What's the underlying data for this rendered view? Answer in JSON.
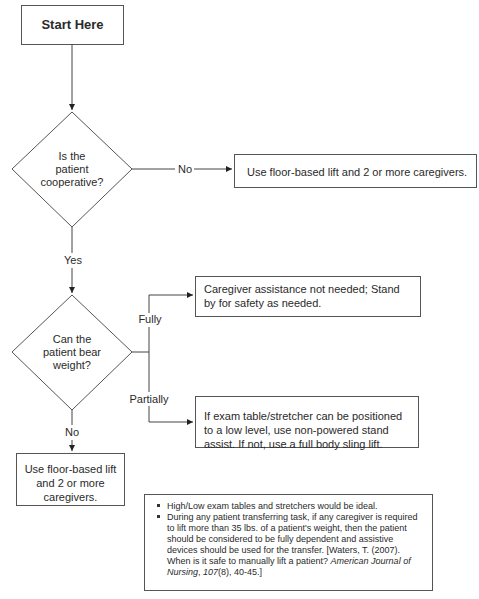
{
  "flowchart": {
    "start": {
      "label": "Start Here"
    },
    "decision1": {
      "line1": "Is the",
      "line2": "patient",
      "line3": "cooperative?"
    },
    "decision1_no_label": "No",
    "decision1_yes_label": "Yes",
    "outcome_not_cooperative": "Use floor-based lift and 2 or more caregivers.",
    "decision2": {
      "line1": "Can the",
      "line2": "patient bear",
      "line3": "weight?"
    },
    "branch_fully_label": "Fully",
    "branch_partially_label": "Partially",
    "branch_no_label": "No",
    "outcome_fully": "Caregiver assistance not needed; Stand by for safety as needed.",
    "outcome_partially": "If exam table/stretcher can be positioned to a low level, use non-powered stand assist. If not, use a full body sling lift.",
    "outcome_no_weight": "Use floor-based lift and 2 or more caregivers."
  },
  "notes": {
    "item1": "High/Low exam tables and stretchers would be ideal.",
    "item2_text": "During any patient transferring task, if any caregiver is required to lift more than 35 lbs. of a patient's weight, then the patient should be considered to be fully dependent and assistive devices should be used for the transfer. [Waters, T. (2007). When is it safe to manually lift a patient? ",
    "item2_journal": "American Journal of Nursing",
    "item2_sep": ", ",
    "item2_volume": "107",
    "item2_end": "(8), 40-45.]"
  }
}
